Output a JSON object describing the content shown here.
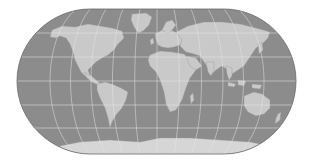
{
  "map": {
    "title": "World map",
    "projection": "pseudo-cylindrical (rounded rectangle)",
    "colors": {
      "background": "#ffffff",
      "ocean": "#8c8c8c",
      "land": "#c9c9c9",
      "graticule": "#e6e6e6",
      "border": "#6a6a6a",
      "antarctica": "#d6d6d6"
    },
    "regions": [
      "North America",
      "South America",
      "Greenland",
      "Europe",
      "Africa",
      "Asia",
      "Australia",
      "Antarctica",
      "New Zealand",
      "Madagascar",
      "Japan",
      "Indonesia",
      "British Isles"
    ]
  }
}
